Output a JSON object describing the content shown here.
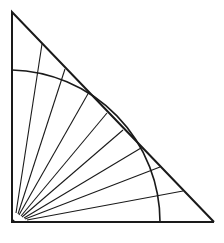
{
  "diagram": {
    "title": "",
    "stroke_color": "#1a1a1a",
    "background": "#ffffff",
    "triangle": {
      "apex_top": [
        12,
        12
      ],
      "right_angle_corner": [
        12,
        222
      ],
      "right_vertex": [
        214,
        222
      ],
      "stroke_width": 2
    },
    "arc": {
      "center": [
        12,
        222
      ],
      "radius": 152,
      "start": [
        12,
        70
      ],
      "end": [
        160,
        222
      ],
      "stroke_width": 1.6
    },
    "rays": {
      "origin_area": [
        14,
        220
      ],
      "count": 8,
      "stroke_width": 1.1,
      "lines": [
        {
          "from": [
            16,
            213
          ],
          "to": [
            42,
            44
          ]
        },
        {
          "from": [
            18,
            214
          ],
          "to": [
            65,
            69
          ]
        },
        {
          "from": [
            19,
            215
          ],
          "to": [
            89,
            92
          ]
        },
        {
          "from": [
            21,
            216
          ],
          "to": [
            107,
            113
          ]
        },
        {
          "from": [
            22,
            217
          ],
          "to": [
            123,
            130
          ]
        },
        {
          "from": [
            24,
            218
          ],
          "to": [
            141,
            148
          ]
        },
        {
          "from": [
            25,
            219
          ],
          "to": [
            160,
            167
          ]
        },
        {
          "from": [
            27,
            220
          ],
          "to": [
            183,
            191
          ]
        }
      ]
    }
  }
}
